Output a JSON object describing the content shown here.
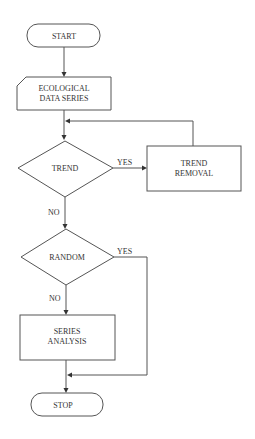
{
  "diagram": {
    "type": "flowchart",
    "colors": {
      "stroke": "#555555",
      "text": "#333333",
      "background": "#ffffff"
    },
    "nodes": {
      "start": {
        "shape": "terminal",
        "lines": [
          "START"
        ]
      },
      "data": {
        "shape": "card",
        "lines": [
          "ECOLOGICAL",
          "DATA SERIES"
        ]
      },
      "trend": {
        "shape": "decision",
        "lines": [
          "TREND"
        ]
      },
      "trend_removal": {
        "shape": "process",
        "lines": [
          "TREND",
          "REMOVAL"
        ]
      },
      "random": {
        "shape": "decision",
        "lines": [
          "RANDOM"
        ]
      },
      "series_analysis": {
        "shape": "process",
        "lines": [
          "SERIES",
          "ANALYSIS"
        ]
      },
      "stop": {
        "shape": "terminal",
        "lines": [
          "STOP"
        ]
      }
    },
    "edges": {
      "trend_yes": "YES",
      "trend_no": "NO",
      "random_yes": "YES",
      "random_no": "NO"
    }
  }
}
